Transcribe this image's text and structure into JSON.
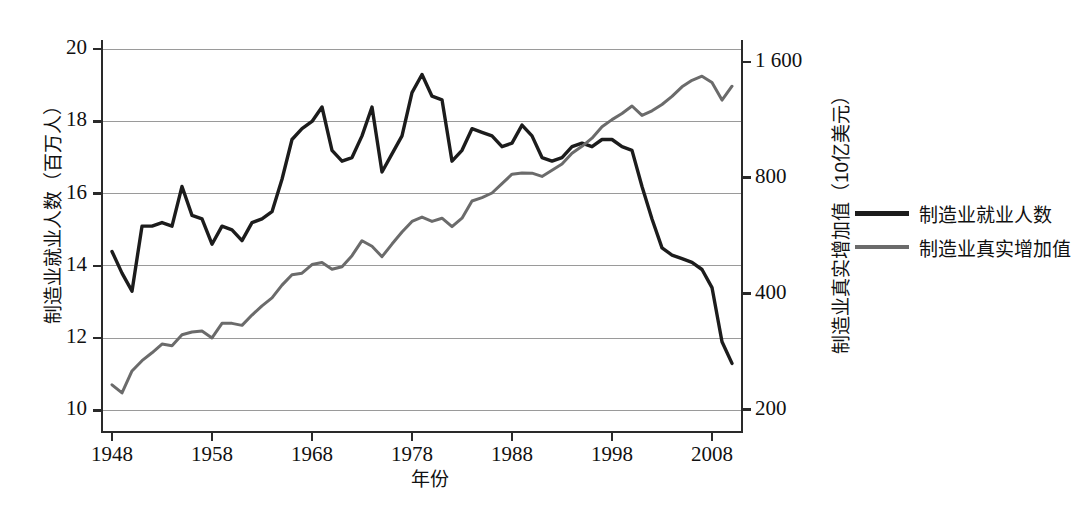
{
  "chart_data": {
    "type": "line",
    "title": "",
    "xlabel": "年份",
    "ylabel_left": "制造业就业人数（百万人）",
    "ylabel_right": "制造业真实增加值（10亿美元）",
    "grid": true,
    "legend_position": "right-outside",
    "x": [
      1948,
      1949,
      1950,
      1951,
      1952,
      1953,
      1954,
      1955,
      1956,
      1957,
      1958,
      1959,
      1960,
      1961,
      1962,
      1963,
      1964,
      1965,
      1966,
      1967,
      1968,
      1969,
      1970,
      1971,
      1972,
      1973,
      1974,
      1975,
      1976,
      1977,
      1978,
      1979,
      1980,
      1981,
      1982,
      1983,
      1984,
      1985,
      1986,
      1987,
      1988,
      1989,
      1990,
      1991,
      1992,
      1993,
      1994,
      1995,
      1996,
      1997,
      1998,
      1999,
      2000,
      2001,
      2002,
      2003,
      2004,
      2005,
      2006,
      2007,
      2008,
      2009,
      2010
    ],
    "xlim": [
      1947,
      2011
    ],
    "xticks": [
      1948,
      1958,
      1968,
      1978,
      1988,
      1998,
      2008
    ],
    "xtick_labels": [
      "1948",
      "1958",
      "1968",
      "1978",
      "1988",
      "1998",
      "2008"
    ],
    "left_axis": {
      "label": "制造业就业人数（百万人）",
      "ticks": [
        10,
        12,
        14,
        16,
        18,
        20
      ],
      "tick_labels": [
        "10",
        "12",
        "14",
        "16",
        "18",
        "20"
      ],
      "lim": [
        9.4,
        20.2
      ],
      "scale": "linear"
    },
    "right_axis": {
      "label": "制造业真实增加值（10亿美元）",
      "ticks": [
        200,
        400,
        800,
        1600
      ],
      "tick_labels": [
        "200",
        "400",
        "800",
        "1 600"
      ],
      "lim": [
        175,
        1800
      ],
      "scale": "log"
    },
    "series": [
      {
        "name": "制造业就业人数",
        "axis": "left",
        "color": "#1c1c1c",
        "width": 3.4,
        "units": "百万人",
        "values": [
          14.4,
          13.8,
          13.3,
          15.1,
          15.1,
          15.2,
          15.1,
          16.2,
          15.4,
          15.3,
          14.6,
          15.1,
          15.0,
          14.7,
          15.2,
          15.3,
          15.5,
          16.4,
          17.5,
          17.8,
          18.0,
          18.4,
          17.2,
          16.9,
          17.0,
          17.6,
          18.4,
          16.6,
          17.1,
          17.6,
          18.8,
          19.3,
          18.7,
          18.6,
          16.9,
          17.2,
          17.8,
          17.7,
          17.6,
          17.3,
          17.4,
          17.9,
          17.6,
          17.0,
          16.9,
          17.0,
          17.3,
          17.4,
          17.3,
          17.5,
          17.5,
          17.3,
          17.2,
          16.2,
          15.3,
          14.5,
          14.3,
          14.2,
          14.1,
          13.9,
          13.4,
          11.9,
          11.3
        ]
      },
      {
        "name": "制造业真实增加值",
        "axis": "right",
        "color": "#6b6b6b",
        "width": 3.0,
        "units": "10亿美元",
        "values": [
          232,
          221,
          252,
          268,
          281,
          296,
          293,
          313,
          318,
          320,
          307,
          335,
          335,
          331,
          352,
          372,
          390,
          421,
          448,
          452,
          476,
          482,
          463,
          470,
          502,
          549,
          531,
          499,
          538,
          578,
          616,
          632,
          616,
          628,
          597,
          628,
          696,
          710,
          730,
          772,
          817,
          823,
          822,
          806,
          836,
          868,
          926,
          965,
          1013,
          1085,
          1132,
          1174,
          1228,
          1161,
          1193,
          1239,
          1300,
          1377,
          1432,
          1467,
          1413,
          1272,
          1382
        ]
      }
    ]
  }
}
